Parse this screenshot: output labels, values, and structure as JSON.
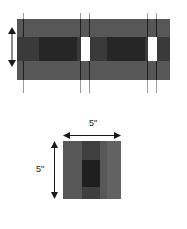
{
  "figure": {
    "views": [
      {
        "name": "elevation-view",
        "description": "Wall elevation showing three horizontal courses with vertical head joints",
        "courses": [
          {
            "name": "top-course",
            "fill": "#575757"
          },
          {
            "name": "middle-course",
            "fill": "#3a3a3a"
          },
          {
            "name": "bottom-course",
            "fill": "#575757"
          }
        ],
        "joint_tick_count": 6,
        "white_gap_count": 2
      },
      {
        "name": "section-view",
        "description": "Square cross section of one masonry unit with central core",
        "width_label": "5\"",
        "height_label": "5\"",
        "bands": [
          {
            "name": "left-band",
            "fill": "#575757"
          },
          {
            "name": "center-band",
            "fill": "#3f3f3f"
          },
          {
            "name": "right-band",
            "fill": "#626262"
          }
        ],
        "core": {
          "name": "center-core",
          "fill": "#1f1f1f"
        }
      }
    ]
  },
  "colors": {
    "light_gray": "#575757",
    "mid_gray": "#3f3f3f",
    "dark_gray": "#262626",
    "core_black": "#1f1f1f",
    "white_gap": "#ffffff",
    "tick_gray": "#9a9a9a",
    "text": "#1a1a1a",
    "background": "#ffffff"
  },
  "dimensions": {
    "width_value": "5\"",
    "height_value": "5\""
  }
}
